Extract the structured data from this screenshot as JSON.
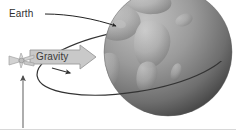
{
  "figure": {
    "background_color": "#ffffff",
    "width": 236,
    "height": 132
  },
  "labels": {
    "earth": "Earth",
    "gravity": "Gravity"
  },
  "colors": {
    "text": "#2f2f2f",
    "orbit_line": "#333333",
    "leader_line": "#222222",
    "globe_ocean": "#8c8c8c",
    "globe_land": "#b9b9b9",
    "globe_shadow": "#4a4a4a",
    "gravity_arrow_fill": "#c9c9c9",
    "gravity_arrow_stroke": "#9a9a9a",
    "satellite_fill": "#d0d0d0",
    "satellite_stroke": "#9d9d9d",
    "axis_line": "#6b6b6b",
    "bottom_rule": "#d8d8d8"
  },
  "elements": {
    "globe": {
      "name": "earth-globe",
      "center_x": 168,
      "center_y": 52,
      "radius": 64,
      "description": "Grayscale globe showing continents, lit from upper-left"
    },
    "orbit": {
      "name": "orbit-ellipse",
      "center_x": 133,
      "center_y": 61,
      "radius_x": 97,
      "radius_y": 31,
      "rotation_deg": -9,
      "direction_marker": "arrowhead on near side pointing right-down"
    },
    "satellite": {
      "name": "satellite",
      "x": 21,
      "y": 61,
      "description": "Small winged satellite on the orbit path at the left"
    },
    "gravity_arrow": {
      "name": "gravity-arrow",
      "from_x": 30,
      "to_x": 96,
      "y": 57,
      "direction": "right",
      "description": "Block arrow pointing from satellite toward Earth"
    },
    "earth_leader": {
      "name": "earth-leader-line",
      "from_x": 45,
      "from_y": 14,
      "to_x": 118,
      "to_y": 27,
      "description": "Leader line with arrowhead from Earth label to globe"
    },
    "vertical_arrow": {
      "name": "velocity-arrow",
      "x": 23,
      "from_y": 128,
      "to_y": 74,
      "direction": "up",
      "description": "Vertical arrow pointing up to the satellite"
    }
  }
}
